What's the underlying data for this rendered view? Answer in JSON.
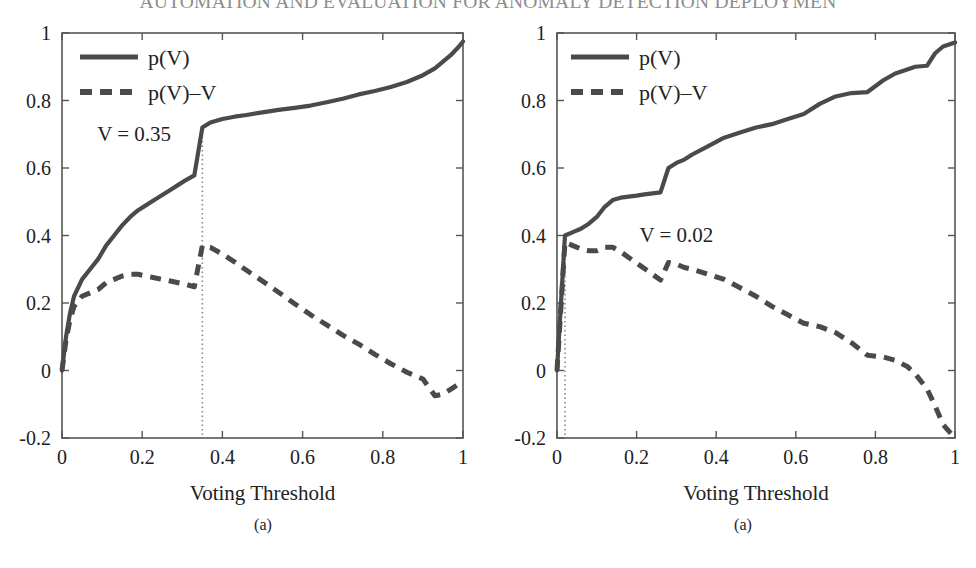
{
  "header": {
    "running_title": "AUTOMATION AND EVALUATION FOR ANOMALY DETECTION DEPLOYMEN"
  },
  "figure": {
    "panels": [
      {
        "id": "a",
        "caption": "(a)",
        "xlabel": "Voting Threshold",
        "annotation": "V = 0.35",
        "legend": [
          "p(V)",
          "p(V)–V"
        ],
        "xticks": [
          "0",
          "0.2",
          "0.4",
          "0.6",
          "0.8",
          "1"
        ],
        "yticks": [
          "1",
          "0.8",
          "0.6",
          "0.4",
          "0.2",
          "0",
          "-0.2"
        ]
      },
      {
        "id": "b",
        "caption": "(a)",
        "xlabel": "Voting Threshold",
        "annotation": "V = 0.02",
        "legend": [
          "p(V)",
          "p(V)–V"
        ],
        "xticks": [
          "0",
          "0.2",
          "0.4",
          "0.6",
          "0.8",
          "1"
        ],
        "yticks": [
          "1",
          "0.8",
          "0.6",
          "0.4",
          "0.2",
          "0",
          "-0.2"
        ]
      }
    ]
  },
  "colors": {
    "curve": "#4a4a4a",
    "axis": "#555555",
    "text": "#222222",
    "header_text": "#8d8d8d",
    "marker_line": "#888888",
    "background": "#ffffff"
  },
  "chart_data": [
    {
      "type": "line",
      "title": "",
      "xlabel": "Voting Threshold",
      "ylabel": "",
      "xlim": [
        0,
        1
      ],
      "ylim": [
        -0.2,
        1
      ],
      "grid": false,
      "legend_position": "top-left",
      "xticks": [
        0,
        0.2,
        0.4,
        0.6,
        0.8,
        1
      ],
      "yticks": [
        -0.2,
        0,
        0.2,
        0.4,
        0.6,
        0.8,
        1
      ],
      "annotations": [
        {
          "text": "V = 0.35",
          "x": 0.18,
          "y": 0.68
        },
        {
          "text": "vertical marker line",
          "x": 0.35,
          "y_from": -0.2,
          "y_to": 0.72
        }
      ],
      "optimal_threshold": 0.35,
      "x": [
        0.0,
        0.01,
        0.02,
        0.03,
        0.05,
        0.07,
        0.09,
        0.11,
        0.13,
        0.15,
        0.17,
        0.19,
        0.21,
        0.23,
        0.25,
        0.27,
        0.29,
        0.31,
        0.33,
        0.35,
        0.37,
        0.4,
        0.43,
        0.46,
        0.5,
        0.54,
        0.58,
        0.62,
        0.66,
        0.7,
        0.74,
        0.78,
        0.82,
        0.86,
        0.9,
        0.93,
        0.95,
        0.97,
        0.99,
        1.0
      ],
      "series": [
        {
          "name": "p(V)",
          "style": "solid",
          "values": [
            0.0,
            0.1,
            0.17,
            0.22,
            0.27,
            0.3,
            0.33,
            0.37,
            0.4,
            0.43,
            0.455,
            0.475,
            0.49,
            0.505,
            0.52,
            0.535,
            0.55,
            0.565,
            0.578,
            0.72,
            0.735,
            0.745,
            0.752,
            0.757,
            0.765,
            0.772,
            0.778,
            0.785,
            0.795,
            0.805,
            0.818,
            0.828,
            0.84,
            0.855,
            0.875,
            0.895,
            0.915,
            0.935,
            0.96,
            0.975
          ]
        },
        {
          "name": "p(V)-V",
          "style": "dashed",
          "values": [
            0.0,
            0.09,
            0.15,
            0.19,
            0.22,
            0.23,
            0.24,
            0.26,
            0.27,
            0.28,
            0.285,
            0.285,
            0.28,
            0.275,
            0.27,
            0.265,
            0.26,
            0.255,
            0.248,
            0.37,
            0.365,
            0.345,
            0.322,
            0.297,
            0.265,
            0.232,
            0.198,
            0.165,
            0.135,
            0.105,
            0.078,
            0.048,
            0.02,
            -0.005,
            -0.025,
            -0.075,
            -0.07,
            -0.055,
            -0.04,
            -0.03
          ]
        }
      ]
    },
    {
      "type": "line",
      "title": "",
      "xlabel": "Voting Threshold",
      "ylabel": "",
      "xlim": [
        0,
        1
      ],
      "ylim": [
        -0.2,
        1
      ],
      "grid": false,
      "legend_position": "top-left",
      "xticks": [
        0,
        0.2,
        0.4,
        0.6,
        0.8,
        1
      ],
      "yticks": [
        -0.2,
        0,
        0.2,
        0.4,
        0.6,
        0.8,
        1
      ],
      "annotations": [
        {
          "text": "V = 0.02",
          "x": 0.3,
          "y": 0.38
        },
        {
          "text": "vertical marker line",
          "x": 0.02,
          "y_from": -0.2,
          "y_to": 0.4
        }
      ],
      "optimal_threshold": 0.02,
      "x": [
        0.0,
        0.02,
        0.04,
        0.06,
        0.08,
        0.1,
        0.12,
        0.14,
        0.16,
        0.18,
        0.2,
        0.22,
        0.24,
        0.26,
        0.28,
        0.3,
        0.32,
        0.34,
        0.38,
        0.42,
        0.46,
        0.5,
        0.54,
        0.58,
        0.62,
        0.66,
        0.7,
        0.74,
        0.78,
        0.82,
        0.85,
        0.88,
        0.9,
        0.93,
        0.95,
        0.97,
        1.0
      ],
      "series": [
        {
          "name": "p(V)",
          "style": "solid",
          "values": [
            0.0,
            0.4,
            0.41,
            0.42,
            0.435,
            0.455,
            0.485,
            0.505,
            0.512,
            0.515,
            0.518,
            0.522,
            0.525,
            0.528,
            0.6,
            0.615,
            0.625,
            0.64,
            0.665,
            0.69,
            0.705,
            0.72,
            0.73,
            0.745,
            0.76,
            0.79,
            0.812,
            0.822,
            0.825,
            0.86,
            0.88,
            0.892,
            0.9,
            0.903,
            0.94,
            0.96,
            0.972
          ]
        },
        {
          "name": "p(V)-V",
          "style": "dashed",
          "values": [
            0.0,
            0.38,
            0.37,
            0.36,
            0.355,
            0.355,
            0.365,
            0.365,
            0.352,
            0.335,
            0.318,
            0.302,
            0.285,
            0.268,
            0.32,
            0.315,
            0.305,
            0.3,
            0.285,
            0.27,
            0.245,
            0.22,
            0.19,
            0.165,
            0.14,
            0.13,
            0.112,
            0.082,
            0.045,
            0.04,
            0.03,
            0.012,
            -0.01,
            -0.055,
            -0.105,
            -0.16,
            -0.2
          ]
        }
      ]
    }
  ]
}
